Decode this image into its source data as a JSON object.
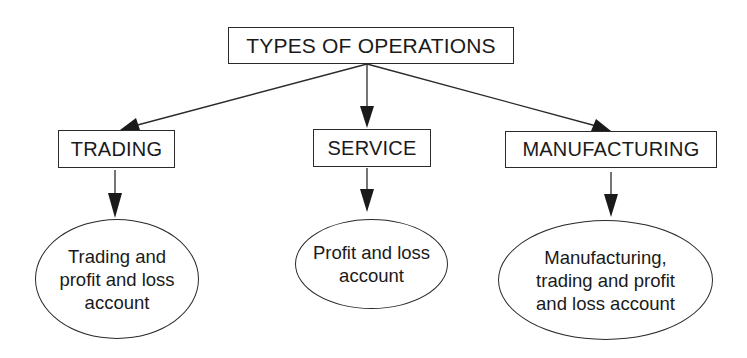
{
  "diagram": {
    "type": "hierarchy",
    "root": {
      "label": "TYPES OF OPERATIONS"
    },
    "categories": [
      {
        "label": "TRADING",
        "account": {
          "lines": [
            "Trading and",
            "profit and loss",
            "account"
          ]
        }
      },
      {
        "label": "SERVICE",
        "account": {
          "lines": [
            "Profit and loss",
            "account"
          ]
        }
      },
      {
        "label": "MANUFACTURING",
        "account": {
          "lines": [
            "Manufacturing,",
            "trading and profit",
            "and loss account"
          ]
        }
      }
    ],
    "edges": [
      {
        "from": "TYPES OF OPERATIONS",
        "to": "TRADING"
      },
      {
        "from": "TYPES OF OPERATIONS",
        "to": "SERVICE"
      },
      {
        "from": "TYPES OF OPERATIONS",
        "to": "MANUFACTURING"
      },
      {
        "from": "TRADING",
        "to": "Trading and profit and loss account"
      },
      {
        "from": "SERVICE",
        "to": "Profit and loss account"
      },
      {
        "from": "MANUFACTURING",
        "to": "Manufacturing, trading and profit and loss account"
      }
    ],
    "colors": {
      "stroke": "#2a2a2a",
      "text": "#1a1a1a",
      "background": "#ffffff"
    }
  }
}
